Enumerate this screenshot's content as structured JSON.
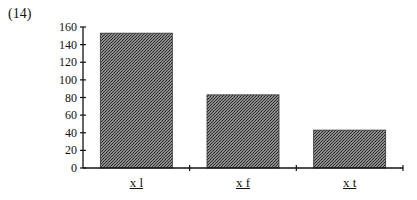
{
  "figure_label": "(14)",
  "chart_data": {
    "type": "bar",
    "title": "",
    "xlabel": "",
    "ylabel": "",
    "categories": [
      "x l",
      "x f",
      "x t"
    ],
    "values": [
      153,
      83,
      43
    ],
    "ylim": [
      0,
      160
    ],
    "yticks": [
      0,
      20,
      40,
      60,
      80,
      100,
      120,
      140,
      160
    ],
    "grid": false,
    "legend": null,
    "bar_fill": "crosshatch gray pattern",
    "bar_color": "#6e6e6e"
  }
}
